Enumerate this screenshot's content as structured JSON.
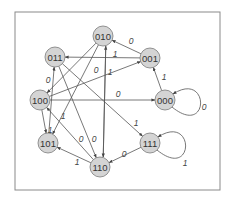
{
  "diagram": {
    "type": "state-transition",
    "frame": {
      "x": 15,
      "y": 12,
      "w": 205,
      "h": 178
    },
    "colors": {
      "node_fill": "#d4d4d4",
      "node_stroke": "#7a7a7a",
      "edge": "#555555",
      "frame": "#8a8a8a"
    },
    "nodes": [
      {
        "id": "010",
        "label": "010",
        "x": 103,
        "y": 36
      },
      {
        "id": "011",
        "label": "011",
        "x": 55,
        "y": 57
      },
      {
        "id": "001",
        "label": "001",
        "x": 150,
        "y": 58
      },
      {
        "id": "100",
        "label": "100",
        "x": 40,
        "y": 100
      },
      {
        "id": "000",
        "label": "000",
        "x": 165,
        "y": 100
      },
      {
        "id": "101",
        "label": "101",
        "x": 48,
        "y": 143
      },
      {
        "id": "111",
        "label": "111",
        "x": 150,
        "y": 143
      },
      {
        "id": "110",
        "label": "110",
        "x": 100,
        "y": 167
      }
    ],
    "edges": [
      {
        "from": "001",
        "to": "010",
        "label": "0",
        "lx": 131,
        "ly": 41
      },
      {
        "from": "001",
        "to": "011",
        "label": "1",
        "lx": 115,
        "ly": 54
      },
      {
        "from": "000",
        "to": "001",
        "label": "1",
        "lx": 164,
        "ly": 77
      },
      {
        "from": "000",
        "to": "000",
        "label": "0",
        "lx": 204,
        "ly": 107,
        "loop": true
      },
      {
        "from": "100",
        "to": "001",
        "label": "1",
        "lx": 110,
        "ly": 72
      },
      {
        "from": "100",
        "to": "000",
        "label": "0",
        "lx": 118,
        "ly": 94
      },
      {
        "from": "010",
        "to": "100",
        "label": "0",
        "lx": 48,
        "ly": 80
      },
      {
        "from": "011",
        "to": "111",
        "label": "1",
        "lx": 136,
        "ly": 123
      },
      {
        "from": "111",
        "to": "111",
        "label": "1",
        "lx": 185,
        "ly": 163,
        "loop": true
      },
      {
        "from": "111",
        "to": "110",
        "label": "0",
        "lx": 124,
        "ly": 154
      },
      {
        "from": "110",
        "to": "101",
        "label": "1",
        "lx": 77,
        "ly": 162
      },
      {
        "from": "110",
        "to": "100",
        "label": "",
        "lx": 0,
        "ly": 0
      },
      {
        "from": "101",
        "to": "011",
        "label": "1",
        "lx": 63,
        "ly": 116
      },
      {
        "from": "100",
        "to": "101",
        "label": "1",
        "lx": 50,
        "ly": 130
      },
      {
        "from": "010",
        "to": "101",
        "label": "",
        "lx": 0,
        "ly": 0
      },
      {
        "from": "110",
        "to": "010",
        "label": "0",
        "lx": 96,
        "ly": 70
      },
      {
        "from": "011",
        "to": "110",
        "label": "0",
        "lx": 81,
        "ly": 139
      },
      {
        "from": "010",
        "to": "110",
        "label": "0",
        "lx": 94,
        "ly": 139
      }
    ]
  }
}
